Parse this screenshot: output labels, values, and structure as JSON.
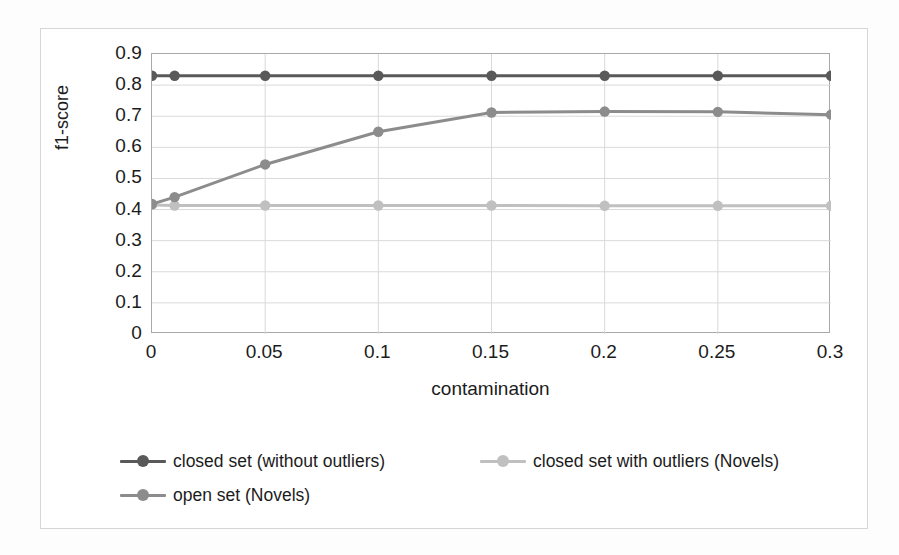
{
  "chart_data": {
    "type": "line",
    "title": "",
    "xlabel": "contamination",
    "ylabel": "f1-score",
    "xlim": [
      0,
      0.3
    ],
    "ylim": [
      0,
      0.9
    ],
    "grid": true,
    "legend_position": "bottom",
    "x": [
      0,
      0.01,
      0.05,
      0.1,
      0.15,
      0.2,
      0.25,
      0.3
    ],
    "x_tick_labels": [
      "0",
      "0.05",
      "0.1",
      "0.15",
      "0.2",
      "0.25",
      "0.3"
    ],
    "x_tick_values": [
      0,
      0.05,
      0.1,
      0.15,
      0.2,
      0.25,
      0.3
    ],
    "y_tick_labels": [
      "0.9",
      "0.8",
      "0.7",
      "0.6",
      "0.5",
      "0.4",
      "0.3",
      "0.2",
      "0.1",
      "0"
    ],
    "y_tick_values": [
      0.9,
      0.8,
      0.7,
      0.6,
      0.5,
      0.4,
      0.3,
      0.2,
      0.1,
      0
    ],
    "series": [
      {
        "name": "closed set (without outliers)",
        "color": "#595959",
        "values": [
          0.83,
          0.83,
          0.83,
          0.83,
          0.83,
          0.83,
          0.83,
          0.83
        ]
      },
      {
        "name": "closed set with outliers  (Novels)",
        "color": "#c0c0c0",
        "values": [
          0.415,
          0.413,
          0.413,
          0.413,
          0.413,
          0.412,
          0.412,
          0.412
        ]
      },
      {
        "name": "open set (Novels)",
        "color": "#8c8c8c",
        "values": [
          0.418,
          0.44,
          0.545,
          0.65,
          0.712,
          0.715,
          0.714,
          0.705
        ]
      }
    ]
  },
  "legend": {
    "rows": [
      [
        {
          "label": "closed set (without outliers)",
          "color": "#595959"
        },
        {
          "label": "closed set with outliers  (Novels)",
          "color": "#c0c0c0"
        }
      ],
      [
        {
          "label": "open set (Novels)",
          "color": "#8c8c8c"
        }
      ]
    ]
  },
  "axes": {
    "y_title": "f1-score",
    "x_title": "contamination"
  },
  "colors": {
    "grid": "#d9d9d9",
    "axis_border": "#a9a9a9",
    "frame": "#d6d6d6",
    "text": "#1c1c1c",
    "background": "#ffffff"
  }
}
